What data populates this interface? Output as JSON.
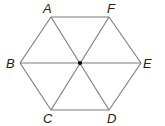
{
  "diagram": {
    "vertices": [
      {
        "id": "A",
        "label": "A",
        "x": 51,
        "y": 17,
        "lx": 43,
        "ly": 13
      },
      {
        "id": "F",
        "label": "F",
        "x": 109,
        "y": 17,
        "lx": 107,
        "ly": 13
      },
      {
        "id": "E",
        "label": "E",
        "x": 141,
        "y": 63,
        "lx": 143,
        "ly": 68
      },
      {
        "id": "D",
        "label": "D",
        "x": 109,
        "y": 110,
        "lx": 107,
        "ly": 123
      },
      {
        "id": "C",
        "label": "C",
        "x": 51,
        "y": 110,
        "lx": 43,
        "ly": 123
      },
      {
        "id": "B",
        "label": "B",
        "x": 20,
        "y": 63,
        "lx": 6,
        "ly": 68
      }
    ],
    "center": {
      "x": 80,
      "y": 63
    },
    "edges": [
      [
        "A",
        "F"
      ],
      [
        "F",
        "E"
      ],
      [
        "E",
        "D"
      ],
      [
        "D",
        "C"
      ],
      [
        "C",
        "B"
      ],
      [
        "B",
        "A"
      ]
    ],
    "diagonals": [
      [
        "A",
        "D"
      ],
      [
        "F",
        "C"
      ],
      [
        "B",
        "E"
      ]
    ],
    "colors": {
      "edge": "#7a7a7a",
      "label": "#222222",
      "center": "#000000"
    }
  }
}
